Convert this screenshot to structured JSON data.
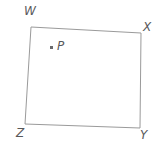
{
  "figure": {
    "type": "quadrilateral-with-interior-point",
    "background_color": "#ffffff",
    "stroke_color": "#9a9a9a",
    "label_color": "#58585a",
    "stroke_width": 1,
    "canvas": {
      "width": 167,
      "height": 149
    },
    "vertices": [
      {
        "name": "W",
        "label": "W",
        "x": 31,
        "y": 27,
        "label_x": 24,
        "label_y": 5
      },
      {
        "name": "X",
        "label": "X",
        "x": 141,
        "y": 33,
        "label_x": 143,
        "label_y": 21
      },
      {
        "name": "Y",
        "label": "Y",
        "x": 140,
        "y": 128,
        "label_x": 140,
        "label_y": 129
      },
      {
        "name": "Z",
        "label": "Z",
        "x": 25,
        "y": 124,
        "label_x": 16,
        "label_y": 127
      }
    ],
    "polygon_points": "31,27 141,33 140,128 25,124",
    "interior_point": {
      "name": "P",
      "label": "P",
      "dot_x": 51,
      "dot_y": 47,
      "label_x": 57,
      "label_y": 40
    }
  }
}
